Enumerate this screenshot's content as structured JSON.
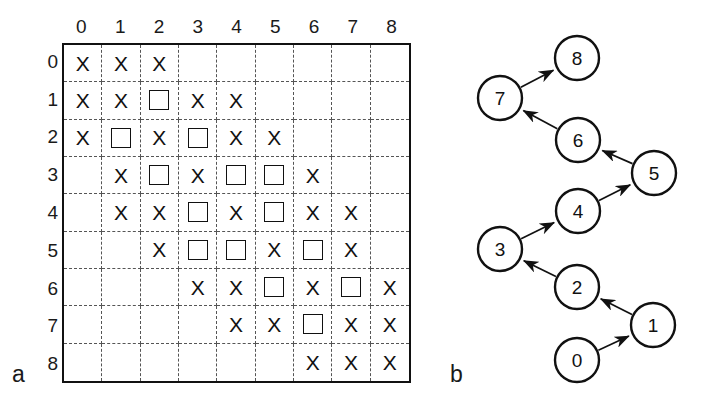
{
  "figure": {
    "panel_a_label": "a",
    "panel_b_label": "b"
  },
  "grid": {
    "column_headers": [
      "0",
      "1",
      "2",
      "3",
      "4",
      "5",
      "6",
      "7",
      "8"
    ],
    "row_headers": [
      "0",
      "1",
      "2",
      "3",
      "4",
      "5",
      "6",
      "7",
      "8"
    ],
    "x_glyph": "X",
    "cells": [
      [
        "X",
        "X",
        "X",
        "",
        "",
        "",
        "",
        "",
        ""
      ],
      [
        "X",
        "X",
        "SQ",
        "X",
        "X",
        "",
        "",
        "",
        ""
      ],
      [
        "X",
        "SQ",
        "X",
        "SQ",
        "X",
        "X",
        "",
        "",
        ""
      ],
      [
        "",
        "X",
        "SQ",
        "X",
        "SQ",
        "SQ",
        "X",
        "",
        ""
      ],
      [
        "",
        "X",
        "X",
        "SQ",
        "X",
        "SQ",
        "X",
        "X",
        ""
      ],
      [
        "",
        "",
        "X",
        "SQ",
        "SQ",
        "X",
        "SQ",
        "X",
        ""
      ],
      [
        "",
        "",
        "",
        "X",
        "X",
        "SQ",
        "X",
        "SQ",
        "X"
      ],
      [
        "",
        "",
        "",
        "",
        "X",
        "X",
        "SQ",
        "X",
        "X"
      ],
      [
        "",
        "",
        "",
        "",
        "",
        "",
        "X",
        "X",
        "X"
      ]
    ]
  },
  "chart_data": {
    "type": "table",
    "title": "",
    "panel_a": {
      "type": "heatmap",
      "description": "9x9 cost/accumulated-distance grid with X (visited) and square (optimal path node) markers",
      "categories": [
        "0",
        "1",
        "2",
        "3",
        "4",
        "5",
        "6",
        "7",
        "8"
      ],
      "row_labels": [
        "0",
        "1",
        "2",
        "3",
        "4",
        "5",
        "6",
        "7",
        "8"
      ],
      "marker_legend": {
        "X": "visited cell",
        "SQ": "path cell"
      },
      "matrix": [
        [
          "X",
          "X",
          "X",
          "",
          "",
          "",
          "",
          "",
          ""
        ],
        [
          "X",
          "X",
          "SQ",
          "X",
          "X",
          "",
          "",
          "",
          ""
        ],
        [
          "X",
          "SQ",
          "X",
          "SQ",
          "X",
          "X",
          "",
          "",
          ""
        ],
        [
          "",
          "X",
          "SQ",
          "X",
          "SQ",
          "SQ",
          "X",
          "",
          ""
        ],
        [
          "",
          "X",
          "X",
          "SQ",
          "X",
          "SQ",
          "X",
          "X",
          ""
        ],
        [
          "",
          "",
          "X",
          "SQ",
          "SQ",
          "X",
          "SQ",
          "X",
          ""
        ],
        [
          "",
          "",
          "",
          "X",
          "X",
          "SQ",
          "X",
          "SQ",
          "X"
        ],
        [
          "",
          "",
          "",
          "",
          "X",
          "X",
          "SQ",
          "X",
          "X"
        ],
        [
          "",
          "",
          "",
          "",
          "",
          "",
          "X",
          "X",
          "X"
        ]
      ],
      "grid": true,
      "axis_position": "top-left"
    },
    "panel_b": {
      "type": "diagram",
      "description": "Directed chain graph of 9 nodes traversing a zigzag path",
      "nodes": [
        {
          "id": "0",
          "label": "0",
          "x": 137,
          "y": 360
        },
        {
          "id": "1",
          "label": "1",
          "x": 213,
          "y": 325
        },
        {
          "id": "2",
          "label": "2",
          "x": 137,
          "y": 287
        },
        {
          "id": "3",
          "label": "3",
          "x": 60,
          "y": 249
        },
        {
          "id": "4",
          "label": "4",
          "x": 138,
          "y": 211
        },
        {
          "id": "5",
          "label": "5",
          "x": 214,
          "y": 173
        },
        {
          "id": "6",
          "label": "6",
          "x": 138,
          "y": 140
        },
        {
          "id": "7",
          "label": "7",
          "x": 60,
          "y": 98
        },
        {
          "id": "8",
          "label": "8",
          "x": 137,
          "y": 58
        }
      ],
      "node_radius": 22,
      "edges": [
        {
          "from": "0",
          "to": "1"
        },
        {
          "from": "1",
          "to": "2"
        },
        {
          "from": "2",
          "to": "3"
        },
        {
          "from": "3",
          "to": "4"
        },
        {
          "from": "4",
          "to": "5"
        },
        {
          "from": "5",
          "to": "6"
        },
        {
          "from": "6",
          "to": "7"
        },
        {
          "from": "7",
          "to": "8"
        }
      ]
    }
  },
  "colors": {
    "stroke": "#111111",
    "dash": "#555555",
    "background": "#ffffff"
  }
}
